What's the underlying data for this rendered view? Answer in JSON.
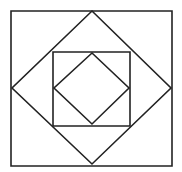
{
  "diagram": {
    "stroke_color": "#222222",
    "background": "#ffffff",
    "shapes": [
      {
        "name": "outer-square",
        "type": "square",
        "points": "11,11 172,11 172,166 11,166"
      },
      {
        "name": "outer-diamond",
        "type": "diamond",
        "points": "92,11 171,88 92,164 12,88"
      },
      {
        "name": "inner-square",
        "type": "square",
        "points": "53,52 130,52 130,126 53,126"
      },
      {
        "name": "inner-diamond",
        "type": "diamond",
        "points": "92,53 129,88 92,124 54,88"
      }
    ]
  }
}
